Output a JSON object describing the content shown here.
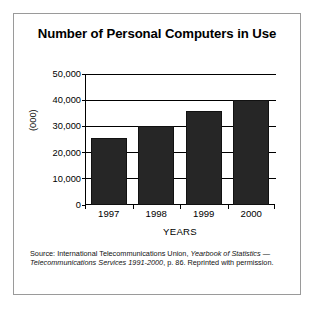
{
  "figure": {
    "title": "Number of Personal Computers in Use",
    "source_prefix": "Source: International Telecommunications Union, ",
    "source_italic_1": "Yearbook of Statistics",
    "source_mid": " — ",
    "source_italic_2": "Telecommunications Services 1991-2000",
    "source_suffix": ", p. 86. Reprinted with permission.",
    "border_color": "#9a9a9a",
    "bar_color": "#262626"
  },
  "chart_data": {
    "type": "bar",
    "title": "Number of Personal Computers in Use",
    "categories": [
      "1997",
      "1998",
      "1999",
      "2000"
    ],
    "values": [
      25500,
      30000,
      36000,
      40000
    ],
    "xlabel": "YEARS",
    "ylabel": "(000)",
    "ylim": [
      0,
      50000
    ],
    "ytick_values": [
      0,
      10000,
      20000,
      30000,
      40000,
      50000
    ],
    "ytick_labels": [
      "0",
      "10,000",
      "20,000",
      "30,000",
      "40,000",
      "50,000"
    ],
    "grid": true,
    "legend": "none",
    "series_color": "#262626"
  }
}
